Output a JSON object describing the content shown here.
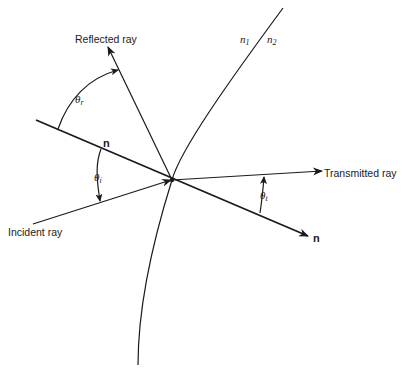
{
  "diagram": {
    "labels": {
      "reflected_ray": "Reflected ray",
      "incident_ray": "Incident ray",
      "transmitted_ray": "Transmitted ray",
      "normal_upper": "n",
      "normal_lower": "n",
      "medium1_base": "n",
      "medium1_sub": "1",
      "medium2_base": "n",
      "medium2_sub": "2",
      "theta_r_base": "θ",
      "theta_r_sub": "r",
      "theta_i_base": "θ",
      "theta_i_sub": "i",
      "theta_t_base": "θ",
      "theta_t_sub": "t"
    },
    "colors": {
      "ink": "#1a1a1a",
      "background": "#ffffff"
    }
  }
}
